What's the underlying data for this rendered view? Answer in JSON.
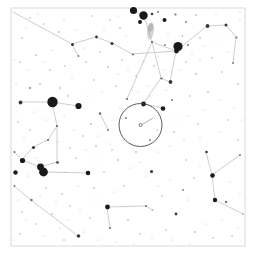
{
  "chart_data": {
    "type": "scatter",
    "title": "",
    "subtitle": "",
    "xlabel": "",
    "ylabel": "",
    "grid": false,
    "legend": null,
    "background_color": "#ffffff",
    "star_color": "#1a1a1a",
    "line_color": "#c8c8cc",
    "frame_color": "#d9d9de",
    "nebula_color": "#9a9a9a",
    "fov_circle_color": "#4a4a4a",
    "xlim": [
      0,
      255
    ],
    "ylim": [
      0,
      258
    ],
    "frame": {
      "x": 11,
      "y": 8,
      "width": 234,
      "height": 238
    },
    "fov_circle": {
      "label": "field-of-view-circle",
      "cx": 140.5,
      "cy": 125.0,
      "r": 21.5
    },
    "fov_center_marker": {
      "label": "target-center-marker",
      "cx": 140.5,
      "cy": 125.0,
      "pointer_from_x": 153.0,
      "pointer_from_y": 118.0,
      "pointer_to_x": 142.5,
      "pointer_to_y": 124.3
    },
    "deep_sky_objects": [
      {
        "name": "fuzzy-patch",
        "cx": 150.5,
        "cy": 31.0,
        "rx": 3.4,
        "ry": 8.5,
        "angle": 8,
        "opacity": 0.42
      },
      {
        "name": "fuzzy-patch-core",
        "cx": 150.5,
        "cy": 27.5,
        "rx": 2.6,
        "ry": 4.2,
        "angle": 8,
        "opacity": 0.5
      }
    ],
    "constellation_lines": [
      {
        "x1": 13,
        "y1": 12,
        "x2": 72,
        "y2": 44
      },
      {
        "x1": 72,
        "y1": 44,
        "x2": 96,
        "y2": 37
      },
      {
        "x1": 96,
        "y1": 37,
        "x2": 112,
        "y2": 43
      },
      {
        "x1": 72,
        "y1": 44,
        "x2": 78,
        "y2": 56
      },
      {
        "x1": 133,
        "y1": 10,
        "x2": 140,
        "y2": 14
      },
      {
        "x1": 140,
        "y1": 14,
        "x2": 146,
        "y2": 22
      },
      {
        "x1": 146,
        "y1": 22,
        "x2": 152,
        "y2": 42
      },
      {
        "x1": 152,
        "y1": 42,
        "x2": 176,
        "y2": 51
      },
      {
        "x1": 176,
        "y1": 51,
        "x2": 207,
        "y2": 26
      },
      {
        "x1": 207,
        "y1": 26,
        "x2": 226,
        "y2": 25
      },
      {
        "x1": 226,
        "y1": 25,
        "x2": 236,
        "y2": 37
      },
      {
        "x1": 236,
        "y1": 37,
        "x2": 233,
        "y2": 63
      },
      {
        "x1": 176,
        "y1": 51,
        "x2": 170,
        "y2": 82
      },
      {
        "x1": 176,
        "y1": 51,
        "x2": 132,
        "y2": 54
      },
      {
        "x1": 132,
        "y1": 54,
        "x2": 112,
        "y2": 43
      },
      {
        "x1": 152,
        "y1": 42,
        "x2": 161,
        "y2": 78
      },
      {
        "x1": 161,
        "y1": 78,
        "x2": 170,
        "y2": 82
      },
      {
        "x1": 161,
        "y1": 78,
        "x2": 143,
        "y2": 104
      },
      {
        "x1": 143,
        "y1": 104,
        "x2": 163,
        "y2": 108
      },
      {
        "x1": 152,
        "y1": 42,
        "x2": 127,
        "y2": 99
      },
      {
        "x1": 20,
        "y1": 102,
        "x2": 52,
        "y2": 102
      },
      {
        "x1": 52,
        "y1": 102,
        "x2": 78,
        "y2": 106
      },
      {
        "x1": 52,
        "y1": 102,
        "x2": 57,
        "y2": 126
      },
      {
        "x1": 57,
        "y1": 126,
        "x2": 48,
        "y2": 140
      },
      {
        "x1": 48,
        "y1": 140,
        "x2": 33,
        "y2": 147
      },
      {
        "x1": 33,
        "y1": 147,
        "x2": 22,
        "y2": 160
      },
      {
        "x1": 22,
        "y1": 160,
        "x2": 40,
        "y2": 167
      },
      {
        "x1": 40,
        "y1": 167,
        "x2": 57,
        "y2": 162
      },
      {
        "x1": 57,
        "y1": 162,
        "x2": 57,
        "y2": 126
      },
      {
        "x1": 43,
        "y1": 172,
        "x2": 88,
        "y2": 173
      },
      {
        "x1": 43,
        "y1": 172,
        "x2": 40,
        "y2": 167
      },
      {
        "x1": 22,
        "y1": 160,
        "x2": 14,
        "y2": 152
      },
      {
        "x1": 31,
        "y1": 200,
        "x2": 78,
        "y2": 236
      },
      {
        "x1": 31,
        "y1": 200,
        "x2": 14,
        "y2": 186
      },
      {
        "x1": 212,
        "y1": 175,
        "x2": 240,
        "y2": 155
      },
      {
        "x1": 212,
        "y1": 175,
        "x2": 206,
        "y2": 152
      },
      {
        "x1": 212,
        "y1": 175,
        "x2": 215,
        "y2": 200
      },
      {
        "x1": 215,
        "y1": 200,
        "x2": 243,
        "y2": 214
      },
      {
        "x1": 107,
        "y1": 207,
        "x2": 146,
        "y2": 206
      },
      {
        "x1": 107,
        "y1": 207,
        "x2": 110,
        "y2": 228
      },
      {
        "x1": 146,
        "y1": 206,
        "x2": 152,
        "y2": 210
      },
      {
        "x1": 100,
        "y1": 113,
        "x2": 108,
        "y2": 130
      }
    ],
    "stars": [
      {
        "x": 133.5,
        "y": 10.5,
        "r": 3.6
      },
      {
        "x": 143.5,
        "y": 15.5,
        "r": 4.2
      },
      {
        "x": 140.0,
        "y": 22.0,
        "r": 2.0
      },
      {
        "x": 152.0,
        "y": 14.0,
        "r": 1.3
      },
      {
        "x": 158.0,
        "y": 12.0,
        "r": 1.0
      },
      {
        "x": 164.5,
        "y": 20.0,
        "r": 2.0
      },
      {
        "x": 175.5,
        "y": 14.5,
        "r": 1.1
      },
      {
        "x": 186.0,
        "y": 22.0,
        "r": 0.9
      },
      {
        "x": 196.0,
        "y": 15.0,
        "r": 0.8
      },
      {
        "x": 207.5,
        "y": 26.0,
        "r": 1.9
      },
      {
        "x": 226.0,
        "y": 25.0,
        "r": 1.5
      },
      {
        "x": 236.5,
        "y": 37.5,
        "r": 1.0
      },
      {
        "x": 233.0,
        "y": 63.0,
        "r": 0.9
      },
      {
        "x": 176.5,
        "y": 51.0,
        "r": 2.4
      },
      {
        "x": 188.0,
        "y": 45.0,
        "r": 1.0
      },
      {
        "x": 200.0,
        "y": 38.0,
        "r": 0.8
      },
      {
        "x": 182.5,
        "y": 36.0,
        "r": 0.8
      },
      {
        "x": 165.0,
        "y": 45.0,
        "r": 0.9
      },
      {
        "x": 178.0,
        "y": 46.5,
        "r": 4.6
      },
      {
        "x": 170.5,
        "y": 82.0,
        "r": 1.9
      },
      {
        "x": 161.5,
        "y": 78.5,
        "r": 1.1
      },
      {
        "x": 152.0,
        "y": 42.0,
        "r": 1.0
      },
      {
        "x": 133.0,
        "y": 54.5,
        "r": 1.0
      },
      {
        "x": 112.0,
        "y": 43.5,
        "r": 1.6
      },
      {
        "x": 96.5,
        "y": 37.0,
        "r": 1.4
      },
      {
        "x": 72.5,
        "y": 44.5,
        "r": 1.5
      },
      {
        "x": 78.5,
        "y": 56.0,
        "r": 0.9
      },
      {
        "x": 59.0,
        "y": 32.0,
        "r": 0.8
      },
      {
        "x": 44.0,
        "y": 24.0,
        "r": 0.7
      },
      {
        "x": 30.0,
        "y": 18.0,
        "r": 0.7
      },
      {
        "x": 22.0,
        "y": 38.0,
        "r": 0.8
      },
      {
        "x": 36.0,
        "y": 55.0,
        "r": 0.8
      },
      {
        "x": 20.0,
        "y": 62.0,
        "r": 0.7
      },
      {
        "x": 50.0,
        "y": 70.0,
        "r": 0.8
      },
      {
        "x": 65.0,
        "y": 66.0,
        "r": 0.7
      },
      {
        "x": 86.0,
        "y": 62.0,
        "r": 0.8
      },
      {
        "x": 100.0,
        "y": 52.0,
        "r": 0.7
      },
      {
        "x": 108.0,
        "y": 67.0,
        "r": 0.8
      },
      {
        "x": 122.0,
        "y": 60.0,
        "r": 0.7
      },
      {
        "x": 120.0,
        "y": 28.0,
        "r": 0.8
      },
      {
        "x": 110.0,
        "y": 20.0,
        "r": 0.7
      },
      {
        "x": 92.0,
        "y": 16.0,
        "r": 0.7
      },
      {
        "x": 186.0,
        "y": 62.0,
        "r": 0.7
      },
      {
        "x": 196.0,
        "y": 74.0,
        "r": 0.8
      },
      {
        "x": 212.0,
        "y": 58.0,
        "r": 0.7
      },
      {
        "x": 222.0,
        "y": 72.0,
        "r": 0.7
      },
      {
        "x": 238.0,
        "y": 84.0,
        "r": 0.8
      },
      {
        "x": 208.0,
        "y": 92.0,
        "r": 0.8
      },
      {
        "x": 190.0,
        "y": 96.0,
        "r": 0.7
      },
      {
        "x": 172.0,
        "y": 100.0,
        "r": 1.0
      },
      {
        "x": 52.5,
        "y": 102.0,
        "r": 5.2
      },
      {
        "x": 78.5,
        "y": 106.0,
        "r": 3.1
      },
      {
        "x": 20.5,
        "y": 102.5,
        "r": 1.9
      },
      {
        "x": 30.0,
        "y": 88.0,
        "r": 0.9
      },
      {
        "x": 40.0,
        "y": 84.0,
        "r": 0.8
      },
      {
        "x": 60.0,
        "y": 88.0,
        "r": 0.8
      },
      {
        "x": 68.0,
        "y": 96.0,
        "r": 0.8
      },
      {
        "x": 57.0,
        "y": 126.0,
        "r": 1.1
      },
      {
        "x": 48.0,
        "y": 140.0,
        "r": 1.1
      },
      {
        "x": 33.5,
        "y": 147.5,
        "r": 1.6
      },
      {
        "x": 22.5,
        "y": 160.5,
        "r": 2.6
      },
      {
        "x": 40.5,
        "y": 167.0,
        "r": 3.4
      },
      {
        "x": 57.5,
        "y": 162.5,
        "r": 1.3
      },
      {
        "x": 43.5,
        "y": 172.0,
        "r": 4.4
      },
      {
        "x": 88.0,
        "y": 173.0,
        "r": 2.3
      },
      {
        "x": 14.5,
        "y": 152.0,
        "r": 1.0
      },
      {
        "x": 15.5,
        "y": 172.5,
        "r": 2.2
      },
      {
        "x": 31.5,
        "y": 200.0,
        "r": 1.2
      },
      {
        "x": 14.5,
        "y": 186.0,
        "r": 0.9
      },
      {
        "x": 78.5,
        "y": 236.0,
        "r": 1.8
      },
      {
        "x": 62.0,
        "y": 194.0,
        "r": 0.8
      },
      {
        "x": 70.0,
        "y": 206.0,
        "r": 0.7
      },
      {
        "x": 52.0,
        "y": 214.0,
        "r": 0.8
      },
      {
        "x": 36.0,
        "y": 224.0,
        "r": 0.7
      },
      {
        "x": 22.0,
        "y": 212.0,
        "r": 0.7
      },
      {
        "x": 20.0,
        "y": 234.0,
        "r": 0.7
      },
      {
        "x": 100.0,
        "y": 113.5,
        "r": 1.2
      },
      {
        "x": 108.0,
        "y": 130.0,
        "r": 0.9
      },
      {
        "x": 91.0,
        "y": 124.0,
        "r": 0.8
      },
      {
        "x": 83.0,
        "y": 136.0,
        "r": 0.7
      },
      {
        "x": 96.0,
        "y": 146.0,
        "r": 0.8
      },
      {
        "x": 112.0,
        "y": 150.0,
        "r": 0.7
      },
      {
        "x": 127.0,
        "y": 99.0,
        "r": 1.1
      },
      {
        "x": 143.5,
        "y": 104.0,
        "r": 2.4
      },
      {
        "x": 163.0,
        "y": 108.5,
        "r": 2.3
      },
      {
        "x": 126.0,
        "y": 118.0,
        "r": 1.0
      },
      {
        "x": 150.0,
        "y": 140.0,
        "r": 0.9
      },
      {
        "x": 136.0,
        "y": 152.0,
        "r": 0.8
      },
      {
        "x": 118.0,
        "y": 160.0,
        "r": 0.8
      },
      {
        "x": 157.0,
        "y": 130.0,
        "r": 0.7
      },
      {
        "x": 174.0,
        "y": 132.0,
        "r": 0.8
      },
      {
        "x": 151.5,
        "y": 171.5,
        "r": 1.6
      },
      {
        "x": 206.5,
        "y": 152.0,
        "r": 1.3
      },
      {
        "x": 212.5,
        "y": 175.5,
        "r": 2.3
      },
      {
        "x": 240.0,
        "y": 155.0,
        "r": 0.9
      },
      {
        "x": 215.0,
        "y": 200.0,
        "r": 2.2
      },
      {
        "x": 226.0,
        "y": 202.0,
        "r": 1.2
      },
      {
        "x": 243.0,
        "y": 214.0,
        "r": 0.8
      },
      {
        "x": 183.0,
        "y": 190.0,
        "r": 0.9
      },
      {
        "x": 176.0,
        "y": 214.0,
        "r": 1.4
      },
      {
        "x": 195.0,
        "y": 232.0,
        "r": 0.8
      },
      {
        "x": 213.0,
        "y": 238.0,
        "r": 0.7
      },
      {
        "x": 232.0,
        "y": 236.0,
        "r": 0.7
      },
      {
        "x": 107.5,
        "y": 207.0,
        "r": 2.4
      },
      {
        "x": 110.0,
        "y": 228.0,
        "r": 1.0
      },
      {
        "x": 146.0,
        "y": 206.0,
        "r": 1.0
      },
      {
        "x": 152.5,
        "y": 210.0,
        "r": 0.8
      },
      {
        "x": 128.0,
        "y": 220.0,
        "r": 0.8
      },
      {
        "x": 140.0,
        "y": 234.0,
        "r": 0.7
      },
      {
        "x": 162.0,
        "y": 196.0,
        "r": 0.7
      },
      {
        "x": 94.0,
        "y": 188.0,
        "r": 0.8
      },
      {
        "x": 76.0,
        "y": 158.0,
        "r": 0.7
      },
      {
        "x": 104.0,
        "y": 172.0,
        "r": 0.7
      },
      {
        "x": 124.0,
        "y": 186.0,
        "r": 0.7
      },
      {
        "x": 198.0,
        "y": 124.0,
        "r": 0.7
      },
      {
        "x": 228.0,
        "y": 120.0,
        "r": 0.7
      },
      {
        "x": 238.0,
        "y": 140.0,
        "r": 0.7
      },
      {
        "x": 186.0,
        "y": 160.0,
        "r": 0.7
      },
      {
        "x": 194.0,
        "y": 178.0,
        "r": 0.7
      },
      {
        "x": 166.0,
        "y": 230.0,
        "r": 0.7
      },
      {
        "x": 90.0,
        "y": 218.0,
        "r": 0.7
      },
      {
        "x": 64.0,
        "y": 240.0,
        "r": 0.7
      },
      {
        "x": 46.0,
        "y": 188.0,
        "r": 0.7
      },
      {
        "x": 30.0,
        "y": 130.0,
        "r": 0.7
      },
      {
        "x": 18.0,
        "y": 122.0,
        "r": 0.7
      },
      {
        "x": 70.0,
        "y": 148.0,
        "r": 0.7
      },
      {
        "x": 154.0,
        "y": 66.0,
        "r": 0.7
      },
      {
        "x": 136.0,
        "y": 76.0,
        "r": 0.7
      },
      {
        "x": 116.0,
        "y": 86.0,
        "r": 0.7
      },
      {
        "x": 94.0,
        "y": 80.0,
        "r": 0.7
      }
    ],
    "faint_stars": [
      {
        "x": 26,
        "y": 28
      },
      {
        "x": 38,
        "y": 14
      },
      {
        "x": 52,
        "y": 50
      },
      {
        "x": 64,
        "y": 20
      },
      {
        "x": 76,
        "y": 30
      },
      {
        "x": 84,
        "y": 48
      },
      {
        "x": 104,
        "y": 30
      },
      {
        "x": 118,
        "y": 16
      },
      {
        "x": 126,
        "y": 36
      },
      {
        "x": 128,
        "y": 70
      },
      {
        "x": 144,
        "y": 62
      },
      {
        "x": 158,
        "y": 56
      },
      {
        "x": 168,
        "y": 34
      },
      {
        "x": 192,
        "y": 54
      },
      {
        "x": 204,
        "y": 46
      },
      {
        "x": 216,
        "y": 40
      },
      {
        "x": 228,
        "y": 52
      },
      {
        "x": 240,
        "y": 20
      },
      {
        "x": 216,
        "y": 14
      },
      {
        "x": 200,
        "y": 60
      },
      {
        "x": 180,
        "y": 70
      },
      {
        "x": 164,
        "y": 70
      },
      {
        "x": 148,
        "y": 86
      },
      {
        "x": 132,
        "y": 90
      },
      {
        "x": 118,
        "y": 74
      },
      {
        "x": 102,
        "y": 92
      },
      {
        "x": 88,
        "y": 96
      },
      {
        "x": 72,
        "y": 78
      },
      {
        "x": 44,
        "y": 62
      },
      {
        "x": 28,
        "y": 70
      },
      {
        "x": 16,
        "y": 84
      },
      {
        "x": 34,
        "y": 112
      },
      {
        "x": 46,
        "y": 120
      },
      {
        "x": 64,
        "y": 116
      },
      {
        "x": 74,
        "y": 130
      },
      {
        "x": 24,
        "y": 138
      },
      {
        "x": 16,
        "y": 112
      },
      {
        "x": 66,
        "y": 172
      },
      {
        "x": 78,
        "y": 186
      },
      {
        "x": 96,
        "y": 160
      },
      {
        "x": 110,
        "y": 144
      },
      {
        "x": 124,
        "y": 140
      },
      {
        "x": 140,
        "y": 162
      },
      {
        "x": 158,
        "y": 152
      },
      {
        "x": 170,
        "y": 146
      },
      {
        "x": 184,
        "y": 140
      },
      {
        "x": 200,
        "y": 138
      },
      {
        "x": 220,
        "y": 132
      },
      {
        "x": 234,
        "y": 108
      },
      {
        "x": 220,
        "y": 100
      },
      {
        "x": 204,
        "y": 110
      },
      {
        "x": 188,
        "y": 116
      },
      {
        "x": 176,
        "y": 120
      },
      {
        "x": 166,
        "y": 90
      },
      {
        "x": 150,
        "y": 96
      },
      {
        "x": 138,
        "y": 92
      },
      {
        "x": 120,
        "y": 108
      },
      {
        "x": 112,
        "y": 120
      },
      {
        "x": 98,
        "y": 136
      },
      {
        "x": 86,
        "y": 150
      },
      {
        "x": 58,
        "y": 142
      },
      {
        "x": 36,
        "y": 158
      },
      {
        "x": 28,
        "y": 176
      },
      {
        "x": 40,
        "y": 196
      },
      {
        "x": 56,
        "y": 202
      },
      {
        "x": 68,
        "y": 220
      },
      {
        "x": 84,
        "y": 232
      },
      {
        "x": 98,
        "y": 240
      },
      {
        "x": 116,
        "y": 242
      },
      {
        "x": 134,
        "y": 244
      },
      {
        "x": 152,
        "y": 238
      },
      {
        "x": 172,
        "y": 240
      },
      {
        "x": 190,
        "y": 244
      },
      {
        "x": 206,
        "y": 224
      },
      {
        "x": 222,
        "y": 220
      },
      {
        "x": 238,
        "y": 228
      },
      {
        "x": 240,
        "y": 194
      },
      {
        "x": 230,
        "y": 182
      },
      {
        "x": 200,
        "y": 166
      },
      {
        "x": 188,
        "y": 200
      },
      {
        "x": 170,
        "y": 180
      },
      {
        "x": 158,
        "y": 186
      },
      {
        "x": 146,
        "y": 176
      },
      {
        "x": 130,
        "y": 168
      },
      {
        "x": 114,
        "y": 192
      },
      {
        "x": 96,
        "y": 200
      },
      {
        "x": 80,
        "y": 210
      },
      {
        "x": 60,
        "y": 228
      },
      {
        "x": 44,
        "y": 236
      },
      {
        "x": 26,
        "y": 220
      },
      {
        "x": 18,
        "y": 200
      },
      {
        "x": 14,
        "y": 240
      },
      {
        "x": 240,
        "y": 240
      },
      {
        "x": 242,
        "y": 120
      },
      {
        "x": 14,
        "y": 60
      },
      {
        "x": 240,
        "y": 12
      }
    ]
  }
}
